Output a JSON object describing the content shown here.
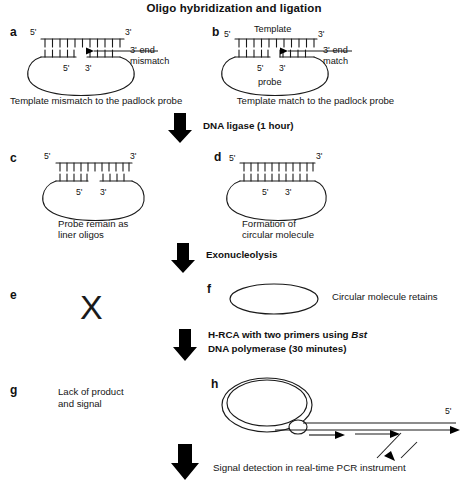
{
  "figure": {
    "title": "Oligo hybridization and ligation",
    "type": "diagram"
  },
  "panels": {
    "a": {
      "letter": "a",
      "five_prime_top_left": "5'",
      "three_prime_top_right": "3'",
      "five_prime_inner": "5'",
      "three_prime_inner": "3'",
      "annotation_line1": "3' end",
      "annotation_line2": "mismatch",
      "caption": "Template mismatch to the padlock probe",
      "top_ticks": 11,
      "bottom_left_ticks": 5,
      "bottom_right_ticks": 4,
      "gapped": true
    },
    "b": {
      "letter": "b",
      "five_prime_top_left": "5'",
      "three_prime_top_right": "3'",
      "template_label": "Template",
      "five_prime_inner": "5'",
      "three_prime_inner": "3'",
      "probe_label": "probe",
      "annotation_line1": "3' end",
      "annotation_line2": "match",
      "caption": "Template match to the padlock probe",
      "top_ticks": 11,
      "bottom_left_ticks": 5,
      "bottom_right_ticks": 4,
      "gapped": false
    },
    "c": {
      "letter": "c",
      "five_prime_top_left": "5'",
      "three_prime_top_right": "3'",
      "five_prime_inner": "5'",
      "three_prime_inner": "3'",
      "caption_line1": "Probe remain as",
      "caption_line2": "liner oligos",
      "top_ticks": 11,
      "bottom_left_ticks": 5,
      "bottom_right_ticks": 4,
      "gapped": true
    },
    "d": {
      "letter": "d",
      "five_prime_top_left": "5'",
      "three_prime_top_right": "3'",
      "five_prime_inner": "5'",
      "three_prime_inner": "3'",
      "caption_line1": "Formation of",
      "caption_line2": "circular molecule",
      "top_ticks": 11,
      "bottom_ticks": 10,
      "gapped": false
    },
    "e": {
      "letter": "e",
      "symbol": "X"
    },
    "f": {
      "letter": "f",
      "caption": "Circular molecule retains"
    },
    "g": {
      "letter": "g",
      "caption_line1": "Lack of product",
      "caption_line2": "and signal"
    },
    "h": {
      "letter": "h",
      "five_prime_label": "5'"
    }
  },
  "steps": [
    {
      "id": "ligase",
      "label": "DNA ligase (1 hour)"
    },
    {
      "id": "exonuclease",
      "label": "Exonucleolysis"
    },
    {
      "id": "hrca_line1",
      "label_pre": "H-RCA with two primers using ",
      "label_italic": "Bst"
    },
    {
      "id": "hrca_line2",
      "label": "DNA polymerase (30 minutes)"
    },
    {
      "id": "detection",
      "label": "Signal detection in real-time PCR instrument"
    }
  ],
  "colors": {
    "ink": "#111111",
    "stroke": "#1a1a1a",
    "background": "#ffffff",
    "arrow_fill": "#000000"
  }
}
